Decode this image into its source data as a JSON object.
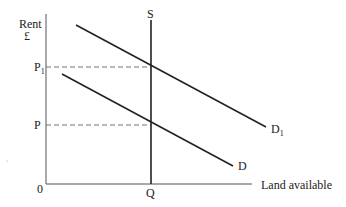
{
  "diagram": {
    "type": "economics supply-demand diagram",
    "colors": {
      "line": "#222222",
      "axis": "#555555",
      "dashed": "#777777",
      "background": "#ffffff"
    },
    "axes": {
      "y_label_line1": "Rent",
      "y_label_line2": "£",
      "x_label": "Land available",
      "origin_label": "0"
    },
    "price_labels": {
      "p1_main": "P",
      "p1_sub": "1",
      "p": "P"
    },
    "quantity_label": "Q",
    "curves": {
      "supply_label": "S",
      "demand_label": "D",
      "demand1_main": "D",
      "demand1_sub": "1"
    }
  }
}
